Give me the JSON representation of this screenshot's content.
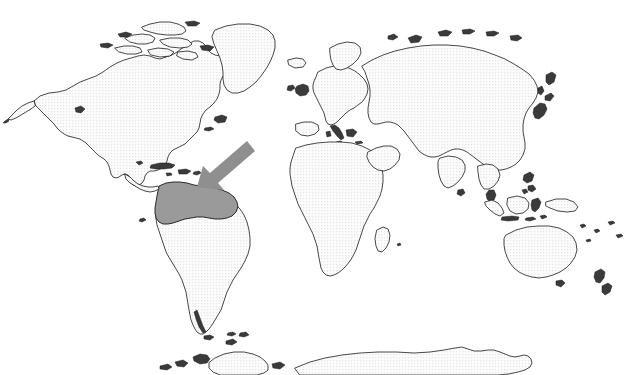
{
  "map": {
    "title": "World Map",
    "projection": "equirectangular",
    "background_color": "#ffffff",
    "land_fill_color": "#f0f0f0",
    "land_stroke_color": "#1a1a1a",
    "highlight_fill_color": "#9a9a9a",
    "arrow_color": "#8f8f8f",
    "width": 631,
    "height": 375
  },
  "highlight": {
    "name": "northern-south-america",
    "label": "",
    "description_regions": [
      "Colombia",
      "Venezuela"
    ],
    "fill": "#9a9a9a"
  },
  "annotation": {
    "arrow": {
      "name": "pointer-arrow",
      "direction": "down-left",
      "tip_x": 197,
      "tip_y": 187,
      "tail_x": 251,
      "tail_y": 147,
      "color": "#8f8f8f"
    }
  },
  "continents": [
    {
      "name": "north-america"
    },
    {
      "name": "south-america"
    },
    {
      "name": "greenland"
    },
    {
      "name": "europe"
    },
    {
      "name": "africa"
    },
    {
      "name": "asia"
    },
    {
      "name": "australia"
    },
    {
      "name": "antarctica"
    }
  ],
  "legend": {
    "items": []
  }
}
